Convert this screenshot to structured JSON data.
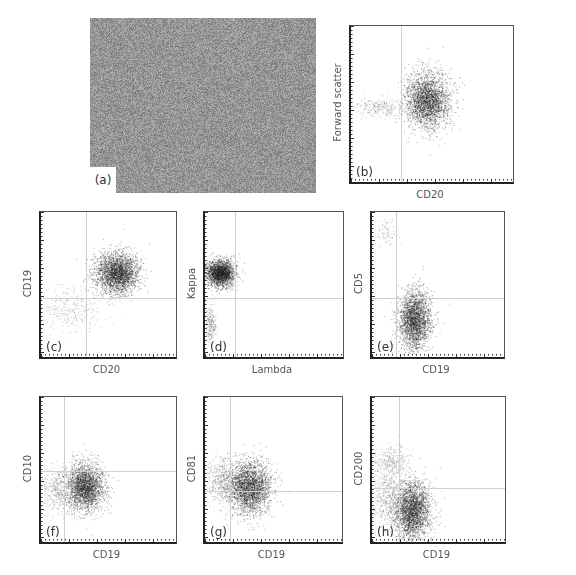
{
  "figure": {
    "panel_a": {
      "label": "(a)",
      "description": "micrograph"
    },
    "panels": [
      {
        "id": "b",
        "label": "(b)",
        "xlabel": "CD20",
        "ylabel": "Forward scatter"
      },
      {
        "id": "c",
        "label": "(c)",
        "xlabel": "CD20",
        "ylabel": "CD19"
      },
      {
        "id": "d",
        "label": "(d)",
        "xlabel": "Lambda",
        "ylabel": "Kappa"
      },
      {
        "id": "e",
        "label": "(e)",
        "xlabel": "CD19",
        "ylabel": "CD5"
      },
      {
        "id": "f",
        "label": "(f)",
        "xlabel": "CD19",
        "ylabel": "CD10"
      },
      {
        "id": "g",
        "label": "(g)",
        "xlabel": "CD19",
        "ylabel": "CD81"
      },
      {
        "id": "h",
        "label": "(h)",
        "xlabel": "CD19",
        "ylabel": "CD200"
      }
    ]
  },
  "chart_data": [
    {
      "type": "scatter",
      "panel": "b",
      "xlabel": "CD20",
      "ylabel": "Forward scatter",
      "gate_x": 0.31,
      "gate_y": null,
      "clusters": [
        {
          "cx": 0.47,
          "cy": 0.52,
          "sx": 0.07,
          "sy": 0.09,
          "n": 2600,
          "note": "dense main population"
        },
        {
          "cx": 0.18,
          "cy": 0.48,
          "sx": 0.08,
          "sy": 0.03,
          "n": 260,
          "note": "faint CD20-negative tail"
        }
      ]
    },
    {
      "type": "scatter",
      "panel": "c",
      "xlabel": "CD20",
      "ylabel": "CD19",
      "gate_x": 0.33,
      "gate_y": 0.41,
      "clusters": [
        {
          "cx": 0.56,
          "cy": 0.58,
          "sx": 0.08,
          "sy": 0.07,
          "n": 2600,
          "note": "CD19+ CD20+"
        },
        {
          "cx": 0.22,
          "cy": 0.33,
          "sx": 0.12,
          "sy": 0.08,
          "n": 300,
          "note": "scattered low population"
        }
      ]
    },
    {
      "type": "scatter",
      "panel": "d",
      "xlabel": "Lambda",
      "ylabel": "Kappa",
      "gate_x": 0.22,
      "gate_y": 0.41,
      "clusters": [
        {
          "cx": 0.11,
          "cy": 0.58,
          "sx": 0.05,
          "sy": 0.045,
          "n": 2200,
          "note": "kappa restricted"
        },
        {
          "cx": 0.04,
          "cy": 0.22,
          "sx": 0.02,
          "sy": 0.07,
          "n": 250,
          "note": "double negative"
        }
      ]
    },
    {
      "type": "scatter",
      "panel": "e",
      "xlabel": "CD19",
      "ylabel": "CD5",
      "gate_x": 0.18,
      "gate_y": 0.41,
      "clusters": [
        {
          "cx": 0.32,
          "cy": 0.26,
          "sx": 0.06,
          "sy": 0.1,
          "n": 2400,
          "note": "CD19+ CD5-"
        },
        {
          "cx": 0.11,
          "cy": 0.86,
          "sx": 0.04,
          "sy": 0.05,
          "n": 80,
          "note": "CD5+ T cells"
        }
      ]
    },
    {
      "type": "scatter",
      "panel": "f",
      "xlabel": "CD19",
      "ylabel": "CD10",
      "gate_x": 0.17,
      "gate_y": 0.49,
      "clusters": [
        {
          "cx": 0.32,
          "cy": 0.38,
          "sx": 0.07,
          "sy": 0.08,
          "n": 2400,
          "note": "CD10 dim/negative"
        },
        {
          "cx": 0.12,
          "cy": 0.36,
          "sx": 0.06,
          "sy": 0.07,
          "n": 400,
          "note": "tail"
        }
      ]
    },
    {
      "type": "scatter",
      "panel": "g",
      "xlabel": "CD19",
      "ylabel": "CD81",
      "gate_x": 0.18,
      "gate_y": 0.35,
      "clusters": [
        {
          "cx": 0.32,
          "cy": 0.38,
          "sx": 0.08,
          "sy": 0.09,
          "n": 2600,
          "note": "CD81+"
        },
        {
          "cx": 0.12,
          "cy": 0.42,
          "sx": 0.06,
          "sy": 0.08,
          "n": 500,
          "note": "tail"
        }
      ]
    },
    {
      "type": "scatter",
      "panel": "h",
      "xlabel": "CD19",
      "ylabel": "CD200",
      "gate_x": 0.2,
      "gate_y": 0.37,
      "clusters": [
        {
          "cx": 0.3,
          "cy": 0.22,
          "sx": 0.07,
          "sy": 0.1,
          "n": 2600,
          "note": "CD200 dim"
        },
        {
          "cx": 0.14,
          "cy": 0.55,
          "sx": 0.07,
          "sy": 0.06,
          "n": 350,
          "note": "CD200+ population"
        },
        {
          "cx": 0.12,
          "cy": 0.3,
          "sx": 0.07,
          "sy": 0.1,
          "n": 500,
          "note": "tail"
        }
      ]
    }
  ]
}
